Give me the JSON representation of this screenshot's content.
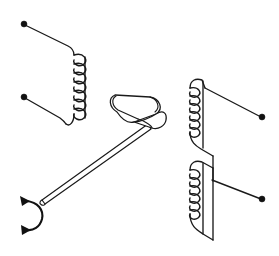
{
  "figure": {
    "kind": "physics-schematic",
    "background_color": "#ffffff",
    "line_color": "#1a1a1a",
    "terminal_color": "#111111",
    "width": 279,
    "height": 256
  },
  "components": {
    "left_coil": {
      "name": "left-coil",
      "turns": 7,
      "axis": "vertical",
      "coil_x": 72,
      "coil_top_y": 52,
      "coil_bottom_y": 118,
      "loop_radius": 7,
      "loop_pitch": 9.5
    },
    "right_upper_coil": {
      "name": "right-upper-coil",
      "turns": 6,
      "axis": "vertical",
      "coil_x": 190,
      "coil_top_y": 85,
      "coil_bottom_y": 133,
      "loop_radius": 6,
      "loop_pitch": 9.2
    },
    "right_lower_coil": {
      "name": "right-lower-coil",
      "turns": 6,
      "axis": "vertical",
      "coil_x": 190,
      "coil_top_y": 168,
      "coil_bottom_y": 216,
      "loop_radius": 6,
      "loop_pitch": 9.2
    },
    "magnet": {
      "name": "bar-magnet",
      "shape": "rounded-rectangle-3d",
      "center_x": 135,
      "center_y": 118,
      "length": 58,
      "thickness": 26,
      "tilt_degrees": -18
    },
    "rod": {
      "name": "rotation-rod",
      "from_x": 43,
      "from_y": 199,
      "to_x": 150,
      "to_y": 130,
      "thickness": 4
    },
    "rotation_arrow": {
      "name": "rotation-arrow",
      "center_x": 31,
      "center_y": 212,
      "radius": 13,
      "double_headed": true,
      "direction": "counter-clockwise"
    }
  },
  "terminals": [
    {
      "name": "left-coil-terminal-top",
      "x": 24,
      "y": 24,
      "radius": 3.0
    },
    {
      "name": "left-coil-terminal-bottom",
      "x": 24,
      "y": 97,
      "radius": 3.0
    },
    {
      "name": "right-coil-terminal-upper",
      "x": 262,
      "y": 117,
      "radius": 3.0
    },
    {
      "name": "right-coil-terminal-lower",
      "x": 262,
      "y": 199,
      "radius": 3.0
    }
  ],
  "paths": {
    "left_lead_top": "M24,24 L70,48 Q73,50 73,53",
    "left_lead_bottom": "M24,97 L62,118 Q66,121 68,124",
    "left_coil_tail_top": "M73,52 Q73,49 70,48",
    "left_coil_tail_bottom": "M66,124 Q68,126 72,127 L76,127",
    "right_upper_lead": "M262,117 L196,84",
    "right_upper_top": "M190,85 Q190,79 196,79 L210,79 L214,82",
    "right_upper_bottom": "M190,134 Q190,140 196,141 L206,146 L212,151",
    "right_connector": "M214,84 L214,178",
    "right_lower_top": "M190,168 Q190,162 196,162 L210,162 L214,166",
    "right_lower_bottom": "M190,217 Q190,223 196,224 L212,232",
    "right_lower_lead": "M262,199 L213,177",
    "right_outer_edge_upper": "M214,82 L214,150",
    "right_outer_edge_lower": "M214,166 L214,234"
  }
}
